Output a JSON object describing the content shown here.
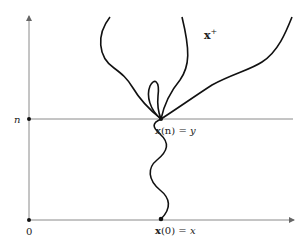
{
  "diagram": {
    "labels": {
      "n_axis": "n",
      "origin": "0",
      "x_plus": "x",
      "x_plus_sup": "+",
      "xn_bold": "x",
      "xn_rest": "(n) = ",
      "xn_y": "y",
      "x0_bold": "x",
      "x0_rest": "(0) = ",
      "x0_x": "x"
    },
    "colors": {
      "axis": "#8a8a8a",
      "path": "#111111",
      "text": "#222222"
    }
  }
}
